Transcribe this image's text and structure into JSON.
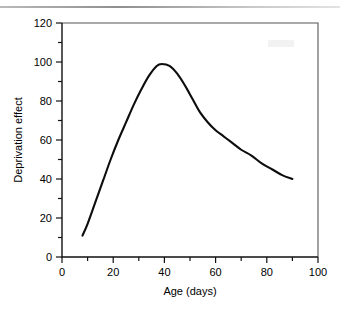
{
  "figure": {
    "background_color": "#ffffff",
    "ink_color": "#000000",
    "top_rule_color": "#8f8f8f"
  },
  "chart_data": {
    "type": "line",
    "title": "",
    "subtitle": "",
    "xlabel": "Age (days)",
    "ylabel": "Deprivation effect",
    "xlim": [
      0,
      100
    ],
    "ylim": [
      0,
      120
    ],
    "grid": false,
    "legend": null,
    "legend_position": "none",
    "x_major_ticks": [
      0,
      20,
      40,
      60,
      80,
      100
    ],
    "x_minor_ticks": [
      10,
      30,
      50,
      70,
      90
    ],
    "x_tick_labels": [
      "0",
      "20",
      "40",
      "60",
      "80",
      "100"
    ],
    "y_major_ticks": [
      0,
      20,
      40,
      60,
      80,
      100,
      120
    ],
    "y_minor_ticks": [
      10,
      30,
      50,
      70,
      90,
      110
    ],
    "y_tick_labels": [
      "0",
      "20",
      "40",
      "60",
      "80",
      "100",
      "120"
    ],
    "series": [
      {
        "name": "Deprivation effect",
        "color": "#0d0d0d",
        "line_width": 2.1,
        "x": [
          8,
          10,
          13,
          16,
          19,
          22,
          25,
          28,
          31,
          34,
          37,
          39,
          42,
          45,
          48,
          51,
          54,
          57,
          60,
          63,
          66,
          70,
          74,
          78,
          82,
          86,
          90
        ],
        "y": [
          11,
          17,
          28,
          39,
          50,
          60,
          69,
          78,
          86,
          93,
          98,
          99,
          98,
          94,
          88,
          81,
          74,
          69,
          65,
          62,
          59,
          55,
          52,
          48,
          45,
          42,
          40
        ]
      }
    ],
    "annotations": [
      {
        "text": "peak",
        "x": 39,
        "y": 99
      }
    ]
  },
  "axis": {
    "x_title": "Age (days)",
    "y_title": "Deprivation effect"
  }
}
